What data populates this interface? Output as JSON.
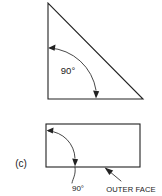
{
  "figure": {
    "part_label": "(c)",
    "background_color": "#ffffff",
    "line_color": "#222222",
    "shapes": {
      "triangle": {
        "name": "right-triangle",
        "vertices": [
          [
            48,
            3
          ],
          [
            48,
            99
          ],
          [
            143,
            99
          ]
        ],
        "right_angle_vertex": [
          48,
          99
        ],
        "angle_label": "90°"
      },
      "rectangle": {
        "name": "rectangle",
        "x": 46,
        "y": 124,
        "width": 94,
        "height": 43,
        "angle_label": "90°"
      }
    },
    "annotations": {
      "triangle_angle": {
        "text": "90°",
        "x": 68,
        "y": 74
      },
      "rectangle_angle": {
        "text": "90°",
        "x": 78,
        "y": 190
      },
      "outer_face": {
        "text": "OUTER FACE",
        "x": 131,
        "y": 191
      }
    }
  }
}
